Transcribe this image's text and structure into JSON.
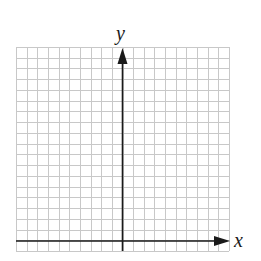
{
  "diagram": {
    "type": "coordinate-grid",
    "axes": {
      "x_label": "x",
      "y_label": "y"
    },
    "grid": {
      "columns": 20,
      "rows": 19,
      "grid_color": "#c8c8c8",
      "axis_color": "#1a1a1a"
    }
  }
}
